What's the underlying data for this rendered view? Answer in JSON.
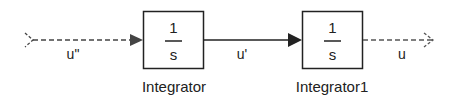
{
  "diagram": {
    "type": "simulink-block-diagram",
    "colors": {
      "line": "#222222",
      "background": "#ffffff"
    },
    "input_signal": {
      "label": "u\"",
      "style": "dashed"
    },
    "blocks": [
      {
        "id": "integrator",
        "name": "Integrator",
        "numerator": "1",
        "denominator": "s"
      },
      {
        "id": "integrator1",
        "name": "Integrator1",
        "numerator": "1",
        "denominator": "s"
      }
    ],
    "connecting_signal": {
      "label": "u'",
      "style": "solid"
    },
    "output_signal": {
      "label": "u",
      "style": "dashed"
    }
  }
}
